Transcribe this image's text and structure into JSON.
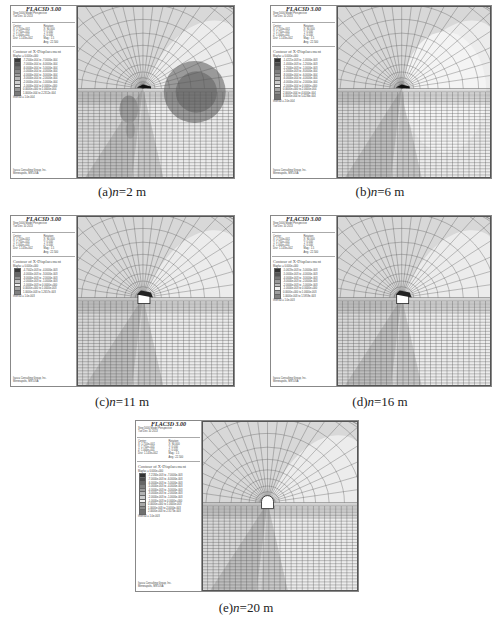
{
  "figure": {
    "software_title": "FLAC3D 3.00",
    "header_lines": [
      "Step 5000 Model Perspective",
      "Tue Dec 10 2013"
    ],
    "view": {
      "center_label": "Center:",
      "rotation_label": "Rotation:",
      "center": [
        "X: 1.750e+001",
        "Y: 1.750e+001",
        "Z: 1.000e+001",
        "Dist: 1.143e+002"
      ],
      "rotation": [
        "X: 90.000",
        "Y: 0.000",
        "Z: 0.000",
        "Mag.: 1.5",
        "Ang.: 22.500"
      ]
    },
    "contour_title": "Contour of X-Displacement",
    "magfac": "Magfac = 0.000e+000",
    "footer": [
      "Itasca Consulting Group, Inc.",
      "Minneapolis, MN USA"
    ]
  },
  "panels": [
    {
      "id": "a",
      "caption_label": "(a)",
      "caption_var": "n",
      "caption_value": "=2 m",
      "legend_rows": [
        "-7.2500e-004 to -7.0000e-004",
        "-7.0000e-004 to -6.0000e-004",
        "-6.0000e-004 to -5.0000e-004",
        "-5.0000e-004 to -4.0000e-004",
        "-4.0000e-004 to -3.0000e-004",
        "-3.0000e-004 to -2.0000e-004",
        "-2.0000e-004 to -1.0000e-004",
        "-1.0000e-004 to 0.0000e+000",
        "0.0000e+000 to 1.0000e-004",
        "1.0000e-004 to 2.2312e-004"
      ],
      "interval": "Interval = 1.0e-004",
      "colors": [
        "#3a3a3a",
        "#555",
        "#6e6e6e",
        "#888",
        "#a0a0a0",
        "#b8b8b8",
        "#d0d0d0",
        "#e6e6e6",
        "#9a9a9a",
        "#7a7a7a"
      ]
    },
    {
      "id": "b",
      "caption_label": "(b)",
      "caption_var": "n",
      "caption_value": "=6 m",
      "legend_rows": [
        "-1.4221e-003 to -1.4000e-003",
        "-1.4000e-003 to -1.2000e-003",
        "-1.2000e-003 to -1.0000e-003",
        "-1.0000e-003 to -8.0000e-004",
        "-8.0000e-004 to -6.0000e-004",
        "-6.0000e-004 to -4.0000e-004",
        "-4.0000e-004 to -2.0000e-004",
        "-2.0000e-004 to 0.0000e+000",
        "0.0000e+000 to 2.0000e-004",
        "2.0000e-004 to 4.0000e-004",
        "4.0000e-004 to 5.4236e-004"
      ],
      "interval": "Interval = 2.0e-004",
      "colors": [
        "#333",
        "#4c4c4c",
        "#666",
        "#7f7f7f",
        "#999",
        "#b2b2b2",
        "#cccccc",
        "#f2f2f2",
        "#a8a8a8",
        "#8c8c8c",
        "#707070"
      ]
    },
    {
      "id": "c",
      "caption_label": "(c)",
      "caption_var": "n",
      "caption_value": "=11 m",
      "legend_rows": [
        "-4.7002e-003 to -4.0000e-003",
        "-4.0000e-003 to -3.0000e-003",
        "-3.0000e-003 to -2.0000e-003",
        "-2.0000e-003 to -1.0000e-003",
        "-1.0000e-003 to 0.0000e+000",
        "0.0000e+000 to 1.0000e-003",
        "1.0000e-003 to 1.2657e-003"
      ],
      "interval": "Interval = 1.0e-003",
      "colors": [
        "#3a3a3a",
        "#666",
        "#929292",
        "#bdbdbd",
        "#f0f0f0",
        "#a6a6a6",
        "#808080"
      ]
    },
    {
      "id": "d",
      "caption_label": "(d)",
      "caption_var": "n",
      "caption_value": "=16 m",
      "legend_rows": [
        "-5.0619e-003 to -5.0000e-003",
        "-5.0000e-003 to -4.0000e-003",
        "-4.0000e-003 to -3.0000e-003",
        "-3.0000e-003 to -2.0000e-003",
        "-2.0000e-003 to -1.0000e-003",
        "-1.0000e-003 to 0.0000e+000",
        "0.0000e+000 to 1.0000e-003",
        "1.0000e-003 to 1.5959e-003"
      ],
      "interval": "Interval = 1.0e-003",
      "colors": [
        "#333",
        "#555",
        "#777",
        "#999",
        "#bbbbbb",
        "#f2f2f2",
        "#a0a0a0",
        "#808080"
      ]
    },
    {
      "id": "e",
      "caption_label": "(e)",
      "caption_var": "n",
      "caption_value": "=20 m",
      "legend_rows": [
        "-7.2184e-003 to -7.0000e-003",
        "-7.0000e-003 to -6.0000e-003",
        "-6.0000e-003 to -5.0000e-003",
        "-5.0000e-003 to -4.0000e-003",
        "-4.0000e-003 to -3.0000e-003",
        "-3.0000e-003 to -2.0000e-003",
        "-2.0000e-003 to -1.0000e-003",
        "-1.0000e-003 to 0.0000e+000",
        "0.0000e+000 to 1.0000e-003",
        "1.0000e-003 to 2.0000e-003",
        "2.0000e-003 to 2.3173e-003"
      ],
      "interval": "Interval = 1.0e-003",
      "colors": [
        "#333",
        "#4c4c4c",
        "#666",
        "#7f7f7f",
        "#999",
        "#b2b2b2",
        "#cccccc",
        "#f2f2f2",
        "#a8a8a8",
        "#8c8c8c",
        "#707070"
      ]
    }
  ]
}
